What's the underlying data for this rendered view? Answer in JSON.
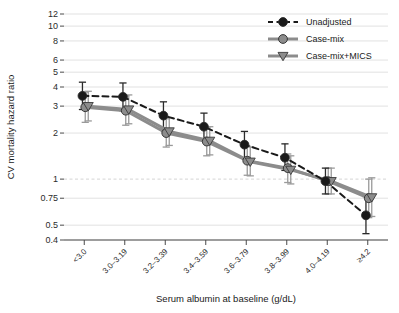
{
  "chart_data": {
    "type": "line",
    "title": "",
    "xlabel": "Serum albumin at baseline (g/dL)",
    "ylabel": "CV mortality hazard ratio",
    "yscale": "log",
    "ylim": [
      0.4,
      12
    ],
    "grid": true,
    "legend_position": "top-right",
    "reference_line": 1,
    "ytick_labels": [
      "12",
      "10",
      "8",
      "6",
      "5",
      "4",
      "3",
      "2",
      "1",
      "0.75",
      "0.5",
      "0.4"
    ],
    "yticks": [
      12,
      10,
      8,
      6,
      5,
      4,
      3,
      2,
      1,
      0.75,
      0.5,
      0.4
    ],
    "categories": [
      "<3.0",
      "3.0–3.19",
      "3.2–3.39",
      "3.4–3.59",
      "3.6–3.79",
      "3.8–3.99",
      "4.0–4.19",
      "≥4.2"
    ],
    "series": [
      {
        "name": "Unadjusted",
        "color": "#1a1a1a",
        "marker": "circle",
        "linestyle": "dashed",
        "values": [
          3.5,
          3.45,
          2.6,
          2.2,
          1.68,
          1.38,
          0.97,
          0.58
        ],
        "ci_low": [
          2.85,
          2.8,
          2.12,
          1.8,
          1.38,
          1.14,
          0.8,
          0.44
        ],
        "ci_high": [
          4.3,
          4.25,
          3.2,
          2.7,
          2.05,
          1.7,
          1.18,
          0.77
        ]
      },
      {
        "name": "Case-mix",
        "color": "#8c8c8c",
        "marker": "circle",
        "linestyle": "solid",
        "values": [
          2.95,
          2.8,
          2.0,
          1.76,
          1.32,
          1.18,
          0.97,
          0.75
        ],
        "ci_low": [
          2.35,
          2.25,
          1.62,
          1.42,
          1.06,
          0.95,
          0.8,
          0.56
        ],
        "ci_high": [
          3.7,
          3.5,
          2.48,
          2.18,
          1.64,
          1.46,
          1.18,
          1.0
        ]
      },
      {
        "name": "Case-mix+MICS",
        "color": "#8c8c8c",
        "marker": "triangle-down",
        "linestyle": "solid",
        "values": [
          3.0,
          2.85,
          2.05,
          1.78,
          1.3,
          1.15,
          0.97,
          0.76
        ],
        "ci_low": [
          2.4,
          2.3,
          1.66,
          1.44,
          1.05,
          0.93,
          0.8,
          0.57
        ],
        "ci_high": [
          3.75,
          3.55,
          2.52,
          2.2,
          1.62,
          1.42,
          1.18,
          1.02
        ]
      }
    ]
  },
  "legend": {
    "items": [
      {
        "label": "Unadjusted"
      },
      {
        "label": "Case-mix"
      },
      {
        "label": "Case-mix+MICS"
      }
    ]
  }
}
